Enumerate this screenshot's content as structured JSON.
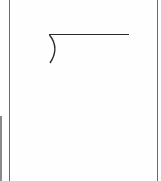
{
  "document": {
    "symbol": "long-division-bracket",
    "stroke_color": "#2a2a2a",
    "border_color": "#6a6a6a"
  }
}
